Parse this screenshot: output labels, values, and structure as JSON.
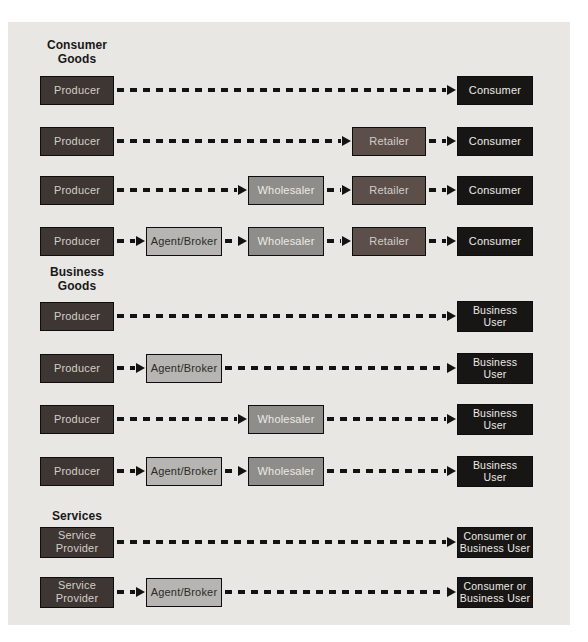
{
  "figure": {
    "panel_bg": "#e9e7e4",
    "page_bg": "#ffffff"
  },
  "colors": {
    "panel_bg": "#e9e7e4",
    "producer_fill": "#3e3632",
    "black_fill": "#181614",
    "retailer_fill": "#5c4f4a",
    "wholesaler_fill": "#8e8d89",
    "agent_fill": "#b6b5b1",
    "light_text": "#d2cec9",
    "white_text": "#eceae6",
    "dark_text": "#2b2b2b",
    "heading_text": "#181818",
    "arrow": "#131313",
    "box_border": "#0d0d0d"
  },
  "sections": [
    {
      "heading": "Consumer\nGoods",
      "rows": [
        {
          "boxes": [
            {
              "label": "Producer",
              "style": "producer",
              "col": "producer"
            },
            {
              "label": "Consumer",
              "style": "black",
              "col": "right"
            }
          ]
        },
        {
          "boxes": [
            {
              "label": "Producer",
              "style": "producer",
              "col": "producer"
            },
            {
              "label": "Retailer",
              "style": "retailer",
              "col": "retailer"
            },
            {
              "label": "Consumer",
              "style": "black",
              "col": "right"
            }
          ]
        },
        {
          "boxes": [
            {
              "label": "Producer",
              "style": "producer",
              "col": "producer"
            },
            {
              "label": "Wholesaler",
              "style": "wholesaler",
              "col": "wholesaler"
            },
            {
              "label": "Retailer",
              "style": "retailer",
              "col": "retailer"
            },
            {
              "label": "Consumer",
              "style": "black",
              "col": "right"
            }
          ]
        },
        {
          "boxes": [
            {
              "label": "Producer",
              "style": "producer",
              "col": "producer"
            },
            {
              "label": "Agent/Broker",
              "style": "agent",
              "col": "agent"
            },
            {
              "label": "Wholesaler",
              "style": "wholesaler",
              "col": "wholesaler"
            },
            {
              "label": "Retailer",
              "style": "retailer",
              "col": "retailer"
            },
            {
              "label": "Consumer",
              "style": "black",
              "col": "right"
            }
          ]
        }
      ]
    },
    {
      "heading": "Business\nGoods",
      "rows": [
        {
          "boxes": [
            {
              "label": "Producer",
              "style": "producer",
              "col": "producer"
            },
            {
              "label": "Business\nUser",
              "style": "black",
              "col": "right"
            }
          ]
        },
        {
          "boxes": [
            {
              "label": "Producer",
              "style": "producer",
              "col": "producer"
            },
            {
              "label": "Agent/Broker",
              "style": "agent",
              "col": "agent"
            },
            {
              "label": "Business\nUser",
              "style": "black",
              "col": "right"
            }
          ]
        },
        {
          "boxes": [
            {
              "label": "Producer",
              "style": "producer",
              "col": "producer"
            },
            {
              "label": "Wholesaler",
              "style": "wholesaler",
              "col": "wholesaler"
            },
            {
              "label": "Business\nUser",
              "style": "black",
              "col": "right"
            }
          ]
        },
        {
          "boxes": [
            {
              "label": "Producer",
              "style": "producer",
              "col": "producer"
            },
            {
              "label": "Agent/Broker",
              "style": "agent",
              "col": "agent"
            },
            {
              "label": "Wholesaler",
              "style": "wholesaler",
              "col": "wholesaler"
            },
            {
              "label": "Business\nUser",
              "style": "black",
              "col": "right"
            }
          ]
        }
      ]
    },
    {
      "heading": "Services",
      "rows": [
        {
          "boxes": [
            {
              "label": "Service\nProvider",
              "style": "producer",
              "col": "producer"
            },
            {
              "label": "Consumer or\nBusiness User",
              "style": "black",
              "col": "right"
            }
          ]
        },
        {
          "boxes": [
            {
              "label": "Service\nProvider",
              "style": "producer",
              "col": "producer"
            },
            {
              "label": "Agent/Broker",
              "style": "agent",
              "col": "agent"
            },
            {
              "label": "Consumer or\nBusiness User",
              "style": "black",
              "col": "right"
            }
          ]
        }
      ]
    }
  ]
}
